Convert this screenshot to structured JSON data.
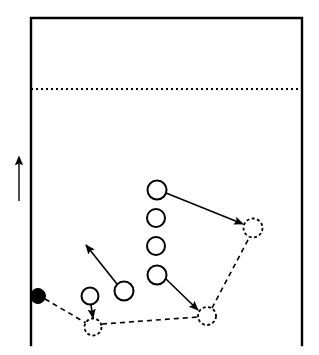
{
  "diagram": {
    "type": "sports-play-diagram",
    "width": 319,
    "height": 355,
    "colors": {
      "line": "#000000",
      "background": "#ffffff",
      "fill_marker": "#000000",
      "open_marker": "#ffffff"
    },
    "court": {
      "name": "court-boundary",
      "left_x": 31,
      "right_x": 302,
      "top_y": 18,
      "bottom_y": 345,
      "stroke_width": 2.4,
      "bottom_open": true
    },
    "attack_line": {
      "name": "attack-line",
      "style": "dotted",
      "y": 89,
      "x1": 31,
      "x2": 302,
      "stroke_width": 2,
      "dash": "2 3"
    },
    "direction_arrow": {
      "name": "direction-arrow",
      "x": 19,
      "y_tail": 201,
      "y_head": 157,
      "stroke_width": 1.4,
      "points": "up"
    },
    "ball": {
      "name": "ball-marker",
      "cx": 38,
      "cy": 296,
      "r": 7.5,
      "filled": true
    },
    "players": [
      {
        "id": "p1",
        "name": "player-1",
        "cx": 157,
        "cy": 190,
        "r": 9.5
      },
      {
        "id": "p2",
        "name": "player-2",
        "cx": 156,
        "cy": 218,
        "r": 9.0
      },
      {
        "id": "p3",
        "name": "player-3",
        "cx": 156,
        "cy": 246,
        "r": 9.0
      },
      {
        "id": "p4",
        "name": "player-4",
        "cx": 157,
        "cy": 275,
        "r": 9.5
      },
      {
        "id": "p5",
        "name": "player-5",
        "cx": 124,
        "cy": 291,
        "r": 9.5
      },
      {
        "id": "p6",
        "name": "player-6",
        "cx": 90,
        "cy": 296,
        "r": 8.5
      }
    ],
    "target_positions": [
      {
        "id": "t1",
        "name": "target-position-1",
        "cx": 253,
        "cy": 228,
        "r": 9.5
      },
      {
        "id": "t2",
        "name": "target-position-2",
        "cx": 207,
        "cy": 316,
        "r": 9.0
      },
      {
        "id": "t3",
        "name": "target-position-3",
        "cx": 93,
        "cy": 327,
        "r": 8.5
      }
    ],
    "movement_arrows": [
      {
        "id": "m1",
        "name": "movement-arrow-player1-to-target1",
        "x1": 166,
        "y1": 193,
        "x2": 243,
        "y2": 224,
        "stroke_width": 1.6
      },
      {
        "id": "m2",
        "name": "movement-arrow-player4-to-target2",
        "x1": 166,
        "y1": 279,
        "x2": 198,
        "y2": 310,
        "stroke_width": 1.6
      },
      {
        "id": "m3",
        "name": "movement-arrow-player5-upleft",
        "x1": 117,
        "y1": 284,
        "x2": 86,
        "y2": 245,
        "stroke_width": 1.6
      },
      {
        "id": "m4",
        "name": "movement-arrow-player6-to-target3",
        "x1": 91,
        "y1": 305,
        "x2": 93,
        "y2": 318,
        "stroke_width": 1.6
      }
    ],
    "ball_path": [
      {
        "id": "b1",
        "name": "ball-path-ball-to-target3",
        "x1": 45,
        "y1": 299,
        "x2": 86,
        "y2": 323,
        "stroke_width": 1.6,
        "dash": "5 4"
      },
      {
        "id": "b2",
        "name": "ball-path-target3-to-target2",
        "x1": 102,
        "y1": 324,
        "x2": 198,
        "y2": 317,
        "stroke_width": 1.6,
        "dash": "5 4"
      },
      {
        "id": "b3",
        "name": "ball-path-target2-to-target1",
        "x1": 212,
        "y1": 308,
        "x2": 249,
        "y2": 238,
        "stroke_width": 1.6,
        "dash": "5 4"
      }
    ]
  }
}
